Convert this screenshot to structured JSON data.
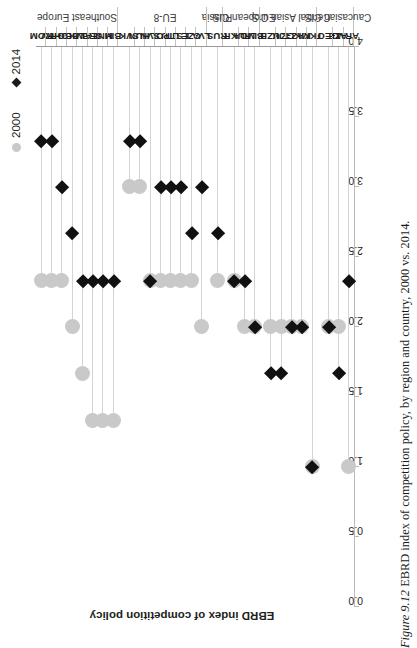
{
  "figure": {
    "number": "Figure 9.12",
    "caption": "EBRD index of competition policy, by region and country, 2000 vs. 2014."
  },
  "legend": {
    "items": [
      {
        "label": "2000",
        "marker": "circle-marker",
        "color": "#c9c9c9"
      },
      {
        "label": "2014",
        "marker": "diamond-marker",
        "color": "#111111"
      }
    ]
  },
  "axis": {
    "title": "EBRD index of competition policy",
    "ticks": [
      "4.0",
      "3.5",
      "3.0",
      "2.5",
      "2.0",
      "1.5",
      "1.0",
      "0.5",
      "0.0"
    ]
  },
  "chart_data": {
    "type": "scatter",
    "title": "EBRD index of competition policy, by region and country, 2000 vs. 2014.",
    "xlabel": "",
    "ylabel": "EBRD index of competition policy",
    "ylim": [
      0.0,
      4.0
    ],
    "grid": false,
    "legend_position": "top-left",
    "orientation": "horizontal-lollipop",
    "categories": [
      "ARM",
      "AZE",
      "GEO",
      "TKM",
      "KAZ",
      "KGZ",
      "TJK",
      "UZB",
      "BLR",
      "MDA",
      "UKR",
      "RUS",
      "LVA",
      "CZE",
      "EST",
      "LTU",
      "POL",
      "SVN",
      "HUN",
      "SVK",
      "BIH",
      "MNE",
      "SRB",
      "ALB",
      "MKD",
      "BGR",
      "HRV",
      "ROM"
    ],
    "regions": [
      {
        "name": "Caucasian CIS",
        "countries": [
          "ARM",
          "AZE",
          "GEO"
        ]
      },
      {
        "name": "Central Asian CIS",
        "countries": [
          "TKM",
          "KAZ",
          "KGZ",
          "TJK",
          "UZB"
        ]
      },
      {
        "name": "European CIS",
        "countries": [
          "BLR",
          "MDA",
          "UKR"
        ]
      },
      {
        "name": "Russia",
        "countries": [
          "RUS"
        ]
      },
      {
        "name": "EU-8",
        "countries": [
          "LVA",
          "CZE",
          "EST",
          "LTU",
          "POL",
          "SVN",
          "HUN",
          "SVK"
        ]
      },
      {
        "name": "Southeast Europe",
        "countries": [
          "BIH",
          "MNE",
          "SRB",
          "ALB",
          "MKD",
          "BGR",
          "HRV",
          "ROM"
        ]
      }
    ],
    "series": [
      {
        "name": "2000",
        "values": [
          1.0,
          2.0,
          2.0,
          1.0,
          2.0,
          2.0,
          2.0,
          2.0,
          2.0,
          2.0,
          2.33,
          2.33,
          2.0,
          2.33,
          2.33,
          2.33,
          2.33,
          2.33,
          3.0,
          3.0,
          1.33,
          1.33,
          1.33,
          1.67,
          2.0,
          2.33,
          2.33,
          2.33
        ]
      },
      {
        "name": "2014",
        "values": [
          2.33,
          1.67,
          2.0,
          1.0,
          2.0,
          2.0,
          1.67,
          1.67,
          2.0,
          2.33,
          2.33,
          2.67,
          3.0,
          2.67,
          3.0,
          3.0,
          3.0,
          2.33,
          3.33,
          3.33,
          2.33,
          2.33,
          2.33,
          2.33,
          2.67,
          3.0,
          3.33,
          3.33
        ]
      }
    ]
  }
}
